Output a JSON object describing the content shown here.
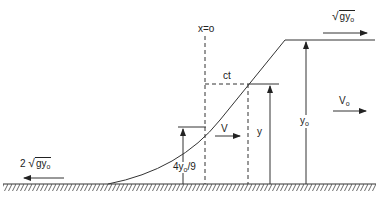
{
  "diagram": {
    "type": "dam-break rarefaction wave profile",
    "labels": {
      "origin": "x=o",
      "ct": "ct",
      "velocity_left": {
        "coef": "2",
        "radicand": "gy",
        "sub": "o"
      },
      "velocity_top": {
        "radicand": "gy",
        "sub": "o"
      },
      "V": "V",
      "V_o": {
        "main": "V",
        "sub": "o"
      },
      "y": "y",
      "y_o": {
        "main": "y",
        "sub": "o"
      },
      "four_yo_9": {
        "pre": "4y",
        "sub": "o",
        "post": "/9"
      }
    },
    "colors": {
      "line": "#333333",
      "text": "#222222",
      "background": "#ffffff"
    }
  }
}
